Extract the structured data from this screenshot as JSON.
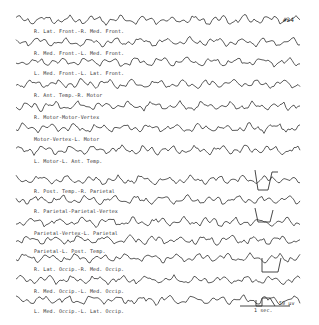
{
  "figure": {
    "figure_number": "#24",
    "channels": [
      {
        "label": "R. Lat. Front.-R. Med. Front.",
        "y": 20
      },
      {
        "label": "R. Med. Front.-L. Med. Front.",
        "y": 42
      },
      {
        "label": "L. Med. Front.-L. Lat. Front.",
        "y": 62
      },
      {
        "label": "R. Ant. Temp.-R. Motor",
        "y": 84
      },
      {
        "label": "R. Motor-Motor-Vertex",
        "y": 106
      },
      {
        "label": "Motor-Vertex-L. Motor",
        "y": 128
      },
      {
        "label": "L. Motor-L. Ant. Temp.",
        "y": 150
      },
      {
        "label": "R. Post. Temp.-R. Parietal",
        "y": 180
      },
      {
        "label": "R. Parietal-Parietal-Vertex",
        "y": 200
      },
      {
        "label": "Parietal-Vertex-L. Parietal",
        "y": 222
      },
      {
        "label": "Parietal-L. Post. Temp.",
        "y": 240
      },
      {
        "label": "R. Lat. Occip.-R. Med. Occip.",
        "y": 258
      },
      {
        "label": "R. Med. Occip.-L. Med. Occip.",
        "y": 280
      },
      {
        "label": "L. Med. Occip.-L. Lat. Occip.",
        "y": 300
      }
    ],
    "scale_bar": {
      "time": "1 sec.",
      "amplitude": "50 µv"
    }
  }
}
